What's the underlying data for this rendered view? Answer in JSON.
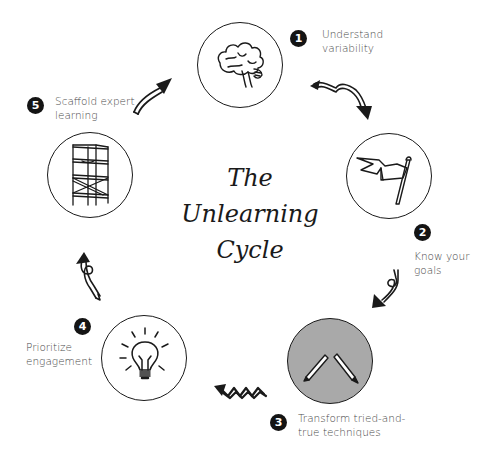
{
  "title": {
    "line1": "The",
    "line2": "Unlearning",
    "line3": "Cycle"
  },
  "steps": [
    {
      "number": "1",
      "label_line1": "Understand",
      "label_line2": "variability",
      "icon": "brain-icon"
    },
    {
      "number": "2",
      "label_line1": "Know your",
      "label_line2": "goals",
      "icon": "flag-icon"
    },
    {
      "number": "3",
      "label_line1": "Transform tried-and-",
      "label_line2": "true techniques",
      "icon": "pencils-icon"
    },
    {
      "number": "4",
      "label_line1": "Prioritize",
      "label_line2": "engagement",
      "icon": "lightbulb-icon"
    },
    {
      "number": "5",
      "label_line1": "Scaffold expert",
      "label_line2": "learning",
      "icon": "scaffold-icon"
    }
  ],
  "colors": {
    "ink": "#1a1a1a",
    "badge": "#141414",
    "highlight_fill": "#a9a9a9",
    "label_text": "#4a4a4a"
  }
}
